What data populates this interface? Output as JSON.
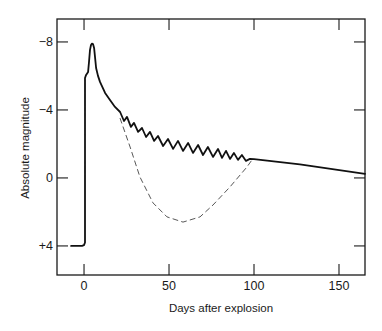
{
  "chart_data": {
    "type": "line",
    "title": "",
    "xlabel": "Days after explosion",
    "ylabel": "Absolute magnitude",
    "xlim": [
      -15.9,
      165.3
    ],
    "ylim": [
      -9.35,
      5.71
    ],
    "y_inverted": true,
    "xticks": [
      0,
      50,
      100,
      150
    ],
    "xtick_labels": [
      "0",
      "50",
      "100",
      "150"
    ],
    "yticks": [
      -8,
      -4,
      0,
      4
    ],
    "ytick_labels": [
      "−8",
      "−4",
      "0",
      "+4"
    ],
    "grid": false,
    "legend": null,
    "ticks_on_all_sides": true,
    "series": [
      {
        "name": "solid curve",
        "style": "solid",
        "color": "#111111",
        "points": [
          [
            -7.6,
            4.0
          ],
          [
            -1.2,
            4.0
          ],
          [
            0.0,
            3.95
          ],
          [
            0.6,
            3.8
          ],
          [
            0.6,
            -5.88
          ],
          [
            1.2,
            -6.06
          ],
          [
            2.4,
            -6.24
          ],
          [
            2.9,
            -6.82
          ],
          [
            3.5,
            -7.53
          ],
          [
            4.1,
            -7.82
          ],
          [
            4.7,
            -7.9
          ],
          [
            5.3,
            -7.88
          ],
          [
            5.9,
            -7.65
          ],
          [
            6.5,
            -7.06
          ],
          [
            7.1,
            -6.47
          ],
          [
            8.2,
            -6.0
          ],
          [
            9.4,
            -5.65
          ],
          [
            12.4,
            -5.0
          ],
          [
            15.3,
            -4.59
          ],
          [
            18.2,
            -4.18
          ],
          [
            21.2,
            -3.88
          ],
          [
            23.5,
            -3.35
          ],
          [
            25.3,
            -3.59
          ],
          [
            27.6,
            -3.0
          ],
          [
            29.4,
            -3.24
          ],
          [
            31.8,
            -2.71
          ],
          [
            34.1,
            -2.94
          ],
          [
            36.5,
            -2.41
          ],
          [
            38.8,
            -2.71
          ],
          [
            41.2,
            -2.18
          ],
          [
            43.5,
            -2.47
          ],
          [
            46.5,
            -1.88
          ],
          [
            49.4,
            -2.29
          ],
          [
            52.4,
            -1.71
          ],
          [
            55.3,
            -2.18
          ],
          [
            58.2,
            -1.59
          ],
          [
            61.2,
            -2.06
          ],
          [
            64.1,
            -1.47
          ],
          [
            67.1,
            -1.94
          ],
          [
            70.0,
            -1.35
          ],
          [
            72.9,
            -1.82
          ],
          [
            75.9,
            -1.24
          ],
          [
            78.8,
            -1.71
          ],
          [
            81.2,
            -1.18
          ],
          [
            83.5,
            -1.59
          ],
          [
            85.9,
            -1.12
          ],
          [
            88.2,
            -1.47
          ],
          [
            90.6,
            -1.06
          ],
          [
            92.9,
            -1.35
          ],
          [
            95.3,
            -1.0
          ],
          [
            97.6,
            -1.12
          ],
          [
            100.0,
            -1.1
          ],
          [
            127.0,
            -0.8
          ],
          [
            165.3,
            -0.24
          ]
        ]
      },
      {
        "name": "dashed curve",
        "style": "dashed",
        "color": "#444444",
        "points": [
          [
            21.2,
            -3.5
          ],
          [
            27.1,
            -1.82
          ],
          [
            32.9,
            -0.06
          ],
          [
            40.6,
            1.47
          ],
          [
            48.8,
            2.29
          ],
          [
            58.2,
            2.6
          ],
          [
            68.2,
            2.29
          ],
          [
            75.9,
            1.59
          ],
          [
            85.9,
            0.53
          ],
          [
            95.9,
            -0.65
          ],
          [
            98.8,
            -1.06
          ]
        ]
      }
    ]
  }
}
